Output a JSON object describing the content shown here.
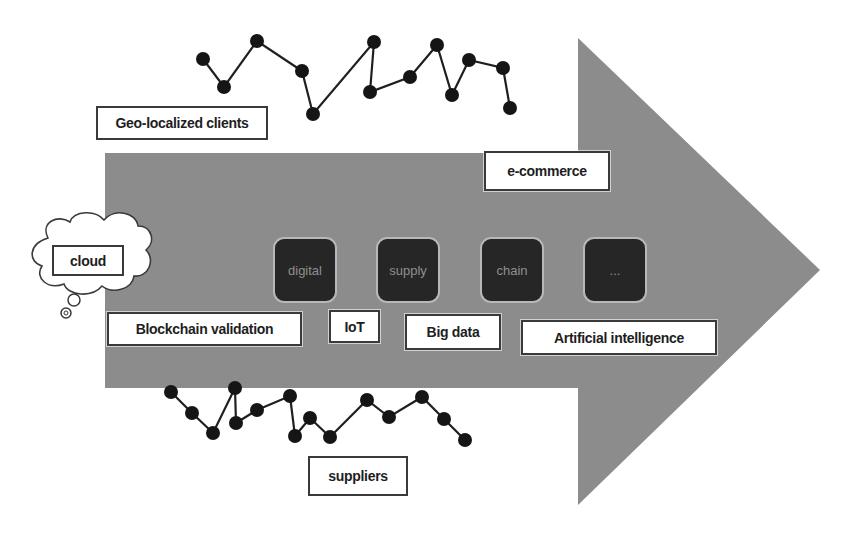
{
  "figure": {
    "colors": {
      "arrow_fill": "#8c8c8c",
      "node_fill": "#151515",
      "edge_stroke": "#1f1f1f",
      "tile_fill": "#262626",
      "tile_border": "#b8b8b8",
      "tile_text": "#8f8f8f",
      "label_border": "#3a3a3a",
      "label_text": "#1e1e1e"
    },
    "arrow": {
      "body": {
        "x1": 105,
        "y1": 153,
        "x2": 578,
        "y2": 388
      },
      "head": {
        "x": 578,
        "top": 38,
        "bottom": 505,
        "tip_x": 820,
        "tip_y": 270
      }
    },
    "labels": {
      "geo_clients": "Geo-localized clients",
      "ecommerce": "e-commerce",
      "cloud": "cloud",
      "blockchain": "Blockchain validation",
      "iot": "IoT",
      "big_data": "Big data",
      "ai": "Artificial intelligence",
      "suppliers": "suppliers"
    },
    "tiles": [
      {
        "label": "digital",
        "x": 273,
        "y": 237
      },
      {
        "label": "supply",
        "x": 376,
        "y": 237
      },
      {
        "label": "chain",
        "x": 480,
        "y": 237
      },
      {
        "label": "...",
        "x": 583,
        "y": 237
      }
    ],
    "clients_network": [
      [
        203,
        59
      ],
      [
        224,
        87
      ],
      [
        257,
        41
      ],
      [
        302,
        71
      ],
      [
        313,
        114
      ],
      [
        374,
        42
      ],
      [
        370,
        92
      ],
      [
        410,
        77
      ],
      [
        437,
        45
      ],
      [
        452,
        95
      ],
      [
        469,
        60
      ],
      [
        503,
        68
      ],
      [
        510,
        108
      ]
    ],
    "suppliers_network": [
      [
        171,
        392
      ],
      [
        192,
        413
      ],
      [
        213,
        433
      ],
      [
        235,
        388
      ],
      [
        236,
        423
      ],
      [
        257,
        410
      ],
      [
        290,
        396
      ],
      [
        295,
        436
      ],
      [
        310,
        418
      ],
      [
        330,
        437
      ],
      [
        367,
        400
      ],
      [
        389,
        417
      ],
      [
        422,
        397
      ],
      [
        444,
        419
      ],
      [
        465,
        440
      ]
    ]
  }
}
